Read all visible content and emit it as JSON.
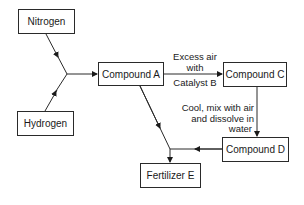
{
  "diagram": {
    "nodes": [
      {
        "id": "nitrogen",
        "label": "Nitrogen"
      },
      {
        "id": "hydrogen",
        "label": "Hydrogen"
      },
      {
        "id": "compound_a",
        "label": "Compound A"
      },
      {
        "id": "compound_c",
        "label": "Compound C"
      },
      {
        "id": "compound_d",
        "label": "Compound D"
      },
      {
        "id": "fertilizer_e",
        "label": "Fertilizer E"
      }
    ],
    "edges": [
      {
        "from": "nitrogen",
        "to": "compound_a",
        "label": ""
      },
      {
        "from": "hydrogen",
        "to": "compound_a",
        "label": ""
      },
      {
        "from": "compound_a",
        "to": "compound_c",
        "label_lines": [
          "Excess air",
          "with",
          "Catalyst B"
        ]
      },
      {
        "from": "compound_c",
        "to": "compound_d",
        "label_lines": [
          "Cool, mix with air",
          "and dissolve in",
          "water"
        ]
      },
      {
        "from": "compound_d",
        "to": "fertilizer_e",
        "label": ""
      },
      {
        "from": "compound_a",
        "to": "fertilizer_e",
        "label": ""
      }
    ]
  }
}
